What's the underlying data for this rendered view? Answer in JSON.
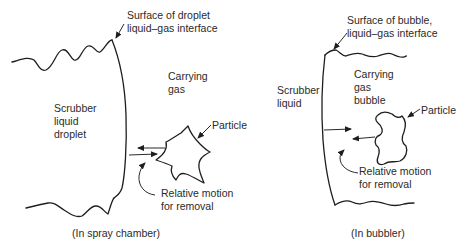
{
  "left_panel": {
    "surface_label_line1": "Surface of droplet",
    "surface_label_line2": "liquid–gas interface",
    "carrying_line1": "Carrying",
    "carrying_line2": "gas",
    "scrubber_line1": "Scrubber",
    "scrubber_line2": "liquid",
    "scrubber_line3": "droplet",
    "particle_label": "Particle",
    "motion_line1": "Relative motion",
    "motion_line2": "for removal",
    "caption": "(In spray chamber)"
  },
  "right_panel": {
    "surface_label_line1": "Surface of bubble,",
    "surface_label_line2": "liquid–gas interface",
    "carrying_line1": "Carrying",
    "carrying_line2": "gas",
    "carrying_line3": "bubble",
    "scrubber_line1": "Scrubber",
    "scrubber_line2": "liquid",
    "particle_label": "Particle",
    "motion_line1": "Relative motion",
    "motion_line2": "for removal",
    "caption": "(In bubbler)"
  }
}
